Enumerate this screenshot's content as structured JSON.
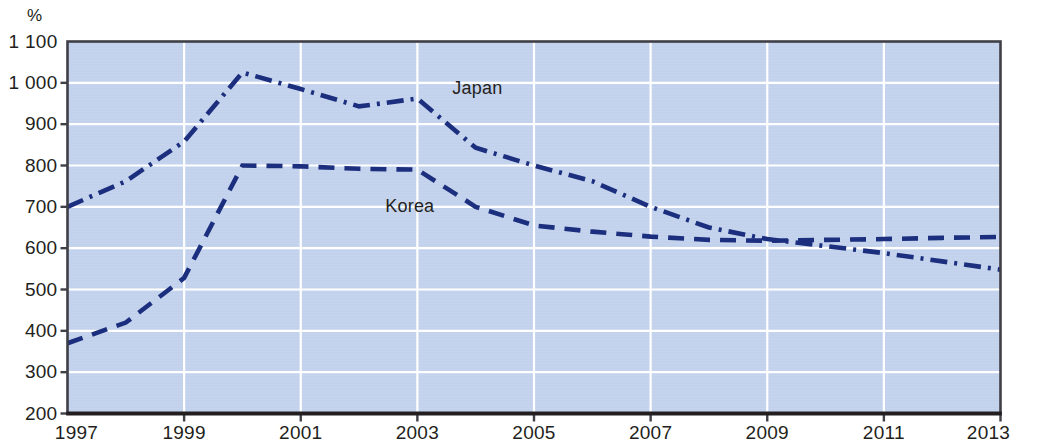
{
  "chart_data": {
    "type": "line",
    "title": "",
    "subtitle": "",
    "xlabel": "",
    "ylabel": "%",
    "unit_label": "%",
    "xlim": [
      1997,
      2013
    ],
    "ylim": [
      200,
      1100
    ],
    "ytick_values": [
      200,
      300,
      400,
      500,
      600,
      700,
      800,
      900,
      1000,
      1100
    ],
    "ytick_labels": [
      "200",
      "300",
      "400",
      "500",
      "600",
      "700",
      "800",
      "900",
      "1 000",
      "1 100"
    ],
    "xtick_values": [
      1997,
      1999,
      2001,
      2003,
      2005,
      2007,
      2009,
      2011,
      2013
    ],
    "xtick_labels": [
      "1997",
      "1999",
      "2001",
      "2003",
      "2005",
      "2007",
      "2009",
      "2011",
      "2013"
    ],
    "x": [
      1997,
      1998,
      1999,
      2000,
      2001,
      2002,
      2003,
      2004,
      2005,
      2006,
      2007,
      2008,
      2009,
      2010,
      2011,
      2012,
      2013
    ],
    "grid": {
      "horizontal": true,
      "vertical": true,
      "color": "#ffffff"
    },
    "legend_position": "inline-annotations",
    "plot_background": "#c3d2ec",
    "line_color": "#1c2f7e",
    "series": [
      {
        "name": "Japan",
        "dash_style": "dash-dot",
        "label_x": 2003.6,
        "label_y": 985,
        "values": [
          700,
          762,
          858,
          1025,
          985,
          943,
          962,
          843,
          800,
          762,
          700,
          650,
          622,
          605,
          588,
          568,
          548
        ]
      },
      {
        "name": "Korea",
        "dash_style": "dashed",
        "label_x": 2002.45,
        "label_y": 700,
        "values": [
          370,
          420,
          528,
          800,
          798,
          792,
          790,
          700,
          655,
          640,
          628,
          620,
          618,
          620,
          622,
          625,
          627
        ]
      }
    ]
  }
}
